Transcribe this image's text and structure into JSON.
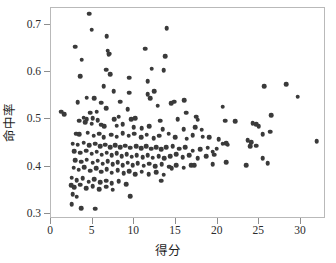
{
  "chart_data": {
    "type": "scatter",
    "title": "",
    "xlabel": "得分",
    "ylabel": "命中率",
    "xlim": [
      0,
      33
    ],
    "ylim": [
      0.29,
      0.735
    ],
    "grid": false,
    "legend": null,
    "xticks": [
      "0",
      "5",
      "10",
      "15",
      "20",
      "25",
      "30"
    ],
    "xtick_values": [
      0,
      5,
      10,
      15,
      20,
      25,
      30
    ],
    "yticks": [
      "0.3",
      "0.4",
      "0.5",
      "0.6",
      "0.7"
    ],
    "ytick_values": [
      0.3,
      0.4,
      0.5,
      0.6,
      0.7
    ],
    "marker": "filled-circle",
    "marker_color": "#3a3a3a",
    "marker_size": 4.6,
    "n_points": 221,
    "points": [
      [
        4.6,
        0.723
      ],
      [
        4.9,
        0.689
      ],
      [
        13.9,
        0.693
      ],
      [
        6.7,
        0.675
      ],
      [
        2.9,
        0.653
      ],
      [
        11.3,
        0.649
      ],
      [
        6.8,
        0.645
      ],
      [
        7.0,
        0.639
      ],
      [
        6.9,
        0.637
      ],
      [
        3.7,
        0.626
      ],
      [
        13.7,
        0.633
      ],
      [
        6.6,
        0.605
      ],
      [
        12.1,
        0.607
      ],
      [
        13.5,
        0.604
      ],
      [
        3.5,
        0.591
      ],
      [
        9.4,
        0.588
      ],
      [
        7.1,
        0.596
      ],
      [
        11.6,
        0.581
      ],
      [
        25.6,
        0.57
      ],
      [
        28.2,
        0.574
      ],
      [
        29.6,
        0.548
      ],
      [
        6.3,
        0.57
      ],
      [
        7.5,
        0.56
      ],
      [
        9.4,
        0.556
      ],
      [
        11.6,
        0.553
      ],
      [
        12.4,
        0.559
      ],
      [
        16.0,
        0.541
      ],
      [
        4.3,
        0.546
      ],
      [
        5.2,
        0.545
      ],
      [
        3.2,
        0.536
      ],
      [
        6.0,
        0.535
      ],
      [
        8.3,
        0.537
      ],
      [
        11.9,
        0.545
      ],
      [
        12.8,
        0.529
      ],
      [
        14.4,
        0.534
      ],
      [
        14.8,
        0.537
      ],
      [
        20.6,
        0.527
      ],
      [
        6.6,
        0.524
      ],
      [
        9.2,
        0.521
      ],
      [
        4.7,
        0.514
      ],
      [
        5.5,
        0.516
      ],
      [
        1.2,
        0.516
      ],
      [
        1.6,
        0.511
      ],
      [
        16.2,
        0.514
      ],
      [
        26.4,
        0.509
      ],
      [
        3.9,
        0.504
      ],
      [
        4.3,
        0.501
      ],
      [
        5.0,
        0.503
      ],
      [
        5.6,
        0.498
      ],
      [
        7.6,
        0.5
      ],
      [
        8.1,
        0.506
      ],
      [
        9.6,
        0.5
      ],
      [
        10.1,
        0.503
      ],
      [
        13.1,
        0.497
      ],
      [
        15.2,
        0.5
      ],
      [
        17.4,
        0.506
      ],
      [
        17.6,
        0.499
      ],
      [
        20.9,
        0.497
      ],
      [
        22.1,
        0.496
      ],
      [
        24.2,
        0.492
      ],
      [
        24.6,
        0.49
      ],
      [
        24.9,
        0.486
      ],
      [
        3.4,
        0.497
      ],
      [
        4.1,
        0.494
      ],
      [
        4.9,
        0.491
      ],
      [
        6.0,
        0.489
      ],
      [
        6.4,
        0.486
      ],
      [
        7.9,
        0.487
      ],
      [
        8.6,
        0.49
      ],
      [
        9.9,
        0.484
      ],
      [
        10.9,
        0.482
      ],
      [
        11.8,
        0.486
      ],
      [
        13.4,
        0.48
      ],
      [
        15.9,
        0.479
      ],
      [
        17.3,
        0.484
      ],
      [
        18.1,
        0.478
      ],
      [
        26.3,
        0.474
      ],
      [
        25.4,
        0.469
      ],
      [
        3.0,
        0.47
      ],
      [
        3.4,
        0.469
      ],
      [
        4.4,
        0.472
      ],
      [
        5.1,
        0.466
      ],
      [
        5.8,
        0.47
      ],
      [
        6.3,
        0.463
      ],
      [
        7.2,
        0.468
      ],
      [
        7.9,
        0.464
      ],
      [
        8.6,
        0.471
      ],
      [
        9.3,
        0.466
      ],
      [
        10.0,
        0.47
      ],
      [
        10.8,
        0.463
      ],
      [
        11.5,
        0.468
      ],
      [
        12.3,
        0.461
      ],
      [
        13.0,
        0.466
      ],
      [
        14.1,
        0.47
      ],
      [
        14.9,
        0.462
      ],
      [
        16.3,
        0.459
      ],
      [
        17.0,
        0.467
      ],
      [
        18.2,
        0.464
      ],
      [
        19.0,
        0.462
      ],
      [
        20.1,
        0.458
      ],
      [
        21.0,
        0.45
      ],
      [
        23.6,
        0.456
      ],
      [
        24.0,
        0.452
      ],
      [
        31.9,
        0.454
      ],
      [
        2.6,
        0.449
      ],
      [
        3.2,
        0.447
      ],
      [
        3.9,
        0.451
      ],
      [
        4.6,
        0.446
      ],
      [
        5.3,
        0.449
      ],
      [
        5.9,
        0.443
      ],
      [
        6.5,
        0.447
      ],
      [
        7.1,
        0.442
      ],
      [
        7.7,
        0.446
      ],
      [
        8.3,
        0.441
      ],
      [
        8.9,
        0.445
      ],
      [
        9.5,
        0.44
      ],
      [
        10.2,
        0.444
      ],
      [
        10.8,
        0.439
      ],
      [
        11.4,
        0.443
      ],
      [
        12.0,
        0.438
      ],
      [
        12.6,
        0.442
      ],
      [
        13.2,
        0.437
      ],
      [
        13.8,
        0.441
      ],
      [
        14.6,
        0.443
      ],
      [
        15.4,
        0.438
      ],
      [
        16.1,
        0.441
      ],
      [
        17.0,
        0.434
      ],
      [
        17.9,
        0.437
      ],
      [
        18.8,
        0.44
      ],
      [
        19.4,
        0.432
      ],
      [
        19.9,
        0.438
      ],
      [
        20.6,
        0.449
      ],
      [
        21.2,
        0.447
      ],
      [
        23.9,
        0.444
      ],
      [
        24.6,
        0.445
      ],
      [
        2.8,
        0.433
      ],
      [
        3.5,
        0.43
      ],
      [
        4.2,
        0.434
      ],
      [
        4.9,
        0.428
      ],
      [
        5.5,
        0.432
      ],
      [
        6.1,
        0.426
      ],
      [
        6.7,
        0.43
      ],
      [
        7.3,
        0.425
      ],
      [
        7.9,
        0.429
      ],
      [
        8.5,
        0.423
      ],
      [
        9.1,
        0.427
      ],
      [
        9.7,
        0.421
      ],
      [
        10.3,
        0.425
      ],
      [
        11.0,
        0.42
      ],
      [
        11.6,
        0.424
      ],
      [
        12.2,
        0.419
      ],
      [
        12.9,
        0.423
      ],
      [
        13.6,
        0.418
      ],
      [
        14.3,
        0.422
      ],
      [
        15.0,
        0.427
      ],
      [
        15.8,
        0.42
      ],
      [
        16.6,
        0.424
      ],
      [
        17.6,
        0.418
      ],
      [
        18.6,
        0.423
      ],
      [
        19.6,
        0.426
      ],
      [
        2.9,
        0.414
      ],
      [
        3.6,
        0.411
      ],
      [
        4.3,
        0.415
      ],
      [
        5.0,
        0.409
      ],
      [
        5.6,
        0.413
      ],
      [
        6.2,
        0.407
      ],
      [
        6.8,
        0.412
      ],
      [
        7.4,
        0.406
      ],
      [
        8.0,
        0.41
      ],
      [
        8.6,
        0.404
      ],
      [
        9.2,
        0.409
      ],
      [
        9.8,
        0.403
      ],
      [
        10.4,
        0.408
      ],
      [
        11.1,
        0.402
      ],
      [
        11.8,
        0.407
      ],
      [
        12.5,
        0.401
      ],
      [
        13.3,
        0.406
      ],
      [
        14.2,
        0.4
      ],
      [
        15.0,
        0.404
      ],
      [
        15.9,
        0.398
      ],
      [
        16.8,
        0.403
      ],
      [
        25.4,
        0.418
      ],
      [
        26.0,
        0.408
      ],
      [
        2.7,
        0.398
      ],
      [
        3.3,
        0.394
      ],
      [
        4.0,
        0.399
      ],
      [
        4.7,
        0.392
      ],
      [
        5.4,
        0.397
      ],
      [
        6.0,
        0.39
      ],
      [
        6.7,
        0.395
      ],
      [
        7.3,
        0.388
      ],
      [
        8.0,
        0.393
      ],
      [
        8.7,
        0.386
      ],
      [
        9.4,
        0.391
      ],
      [
        10.1,
        0.385
      ],
      [
        10.9,
        0.39
      ],
      [
        11.7,
        0.384
      ],
      [
        12.6,
        0.389
      ],
      [
        13.5,
        0.383
      ],
      [
        14.5,
        0.397
      ],
      [
        17.2,
        0.404
      ],
      [
        19.4,
        0.405
      ],
      [
        21.0,
        0.41
      ],
      [
        23.4,
        0.404
      ],
      [
        2.5,
        0.377
      ],
      [
        3.1,
        0.372
      ],
      [
        3.8,
        0.376
      ],
      [
        4.5,
        0.369
      ],
      [
        5.2,
        0.374
      ],
      [
        5.9,
        0.367
      ],
      [
        6.6,
        0.371
      ],
      [
        7.3,
        0.365
      ],
      [
        8.1,
        0.37
      ],
      [
        9.0,
        0.363
      ],
      [
        13.2,
        0.371
      ],
      [
        2.4,
        0.361
      ],
      [
        2.8,
        0.357
      ],
      [
        3.5,
        0.362
      ],
      [
        4.2,
        0.355
      ],
      [
        5.0,
        0.359
      ],
      [
        5.8,
        0.353
      ],
      [
        6.6,
        0.358
      ],
      [
        7.4,
        0.352
      ],
      [
        2.6,
        0.342
      ],
      [
        3.1,
        0.337
      ],
      [
        9.5,
        0.338
      ],
      [
        2.5,
        0.321
      ],
      [
        3.6,
        0.313
      ],
      [
        5.3,
        0.312
      ]
    ]
  }
}
